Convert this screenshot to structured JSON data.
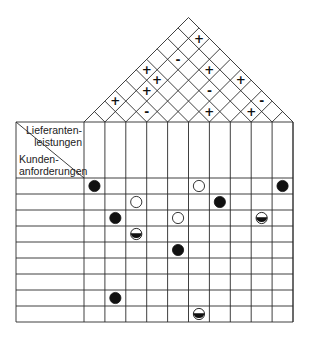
{
  "diagram": {
    "type": "house-of-quality",
    "header": {
      "top_right_label_lines": [
        "Lieferanten-",
        "leistungen"
      ],
      "bottom_left_label_lines": [
        "Kunden-",
        "anforderungen"
      ]
    },
    "columns": 10,
    "rows": 9,
    "colors": {
      "line": "#2a2a2a",
      "symbol": "#111111",
      "background": "#ffffff"
    },
    "roof_correlations": [
      {
        "i": 1,
        "j": 9,
        "symbol": "+"
      },
      {
        "i": 1,
        "j": 7,
        "symbol": "-"
      },
      {
        "i": 0,
        "j": 5,
        "symbol": "+"
      },
      {
        "i": 3,
        "j": 8,
        "symbol": "+"
      },
      {
        "i": 1,
        "j": 5,
        "symbol": "+"
      },
      {
        "i": 5,
        "j": 9,
        "symbol": "+"
      },
      {
        "i": 1,
        "j": 4,
        "symbol": "+"
      },
      {
        "i": 4,
        "j": 7,
        "symbol": "-"
      },
      {
        "i": 0,
        "j": 2,
        "symbol": "+"
      },
      {
        "i": 7,
        "j": 9,
        "symbol": "-"
      },
      {
        "i": 2,
        "j": 3,
        "symbol": "-"
      },
      {
        "i": 5,
        "j": 6,
        "symbol": "+"
      },
      {
        "i": 7,
        "j": 8,
        "symbol": "+"
      }
    ],
    "relationship_legend": {
      "filled": "filled-circle",
      "half": "half-filled-circle",
      "open": "open-circle"
    },
    "relationships": [
      {
        "row": 0,
        "col": 0,
        "type": "filled"
      },
      {
        "row": 0,
        "col": 5,
        "type": "open"
      },
      {
        "row": 0,
        "col": 9,
        "type": "filled"
      },
      {
        "row": 1,
        "col": 2,
        "type": "open"
      },
      {
        "row": 1,
        "col": 6,
        "type": "filled"
      },
      {
        "row": 2,
        "col": 1,
        "type": "filled"
      },
      {
        "row": 2,
        "col": 4,
        "type": "open"
      },
      {
        "row": 2,
        "col": 8,
        "type": "half"
      },
      {
        "row": 3,
        "col": 2,
        "type": "half"
      },
      {
        "row": 4,
        "col": 4,
        "type": "filled"
      },
      {
        "row": 7,
        "col": 1,
        "type": "filled"
      },
      {
        "row": 8,
        "col": 5,
        "type": "half"
      }
    ]
  }
}
